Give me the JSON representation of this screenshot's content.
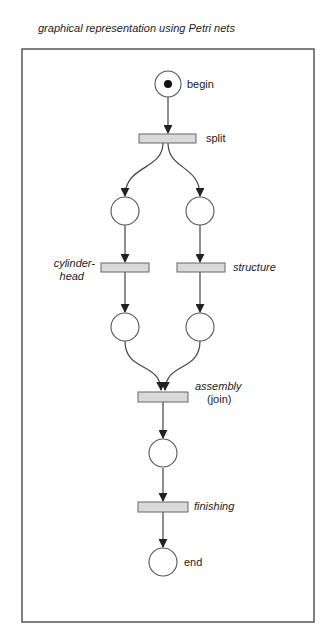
{
  "title": "graphical representation using Petri nets",
  "colors": {
    "frame": "#555555",
    "stroke": "#444444",
    "transition_fill": "#d9d9d9",
    "place_fill": "#ffffff",
    "token": "#111111",
    "arrow": "#222222"
  },
  "places": [
    {
      "id": "p_begin",
      "label": "begin",
      "tokens": 1
    },
    {
      "id": "p_left1",
      "label": "",
      "tokens": 0
    },
    {
      "id": "p_right1",
      "label": "",
      "tokens": 0
    },
    {
      "id": "p_left2",
      "label": "",
      "tokens": 0
    },
    {
      "id": "p_right2",
      "label": "",
      "tokens": 0
    },
    {
      "id": "p_mid",
      "label": "",
      "tokens": 0
    },
    {
      "id": "p_end",
      "label": "end",
      "tokens": 0
    }
  ],
  "transitions": [
    {
      "id": "t_split",
      "label": "split",
      "italic": false
    },
    {
      "id": "t_cylinder",
      "label_line1": "cylinder-",
      "label_line2": "head",
      "italic": true
    },
    {
      "id": "t_structure",
      "label": "structure",
      "italic": true
    },
    {
      "id": "t_assembly",
      "label_line1": "assembly",
      "label_line2": "(join)",
      "italic": true
    },
    {
      "id": "t_finishing",
      "label": "finishing",
      "italic": true
    }
  ],
  "arcs": [
    [
      "p_begin",
      "t_split"
    ],
    [
      "t_split",
      "p_left1"
    ],
    [
      "t_split",
      "p_right1"
    ],
    [
      "p_left1",
      "t_cylinder"
    ],
    [
      "p_right1",
      "t_structure"
    ],
    [
      "t_cylinder",
      "p_left2"
    ],
    [
      "t_structure",
      "p_right2"
    ],
    [
      "p_left2",
      "t_assembly"
    ],
    [
      "p_right2",
      "t_assembly"
    ],
    [
      "t_assembly",
      "p_mid"
    ],
    [
      "p_mid",
      "t_finishing"
    ],
    [
      "t_finishing",
      "p_end"
    ]
  ]
}
